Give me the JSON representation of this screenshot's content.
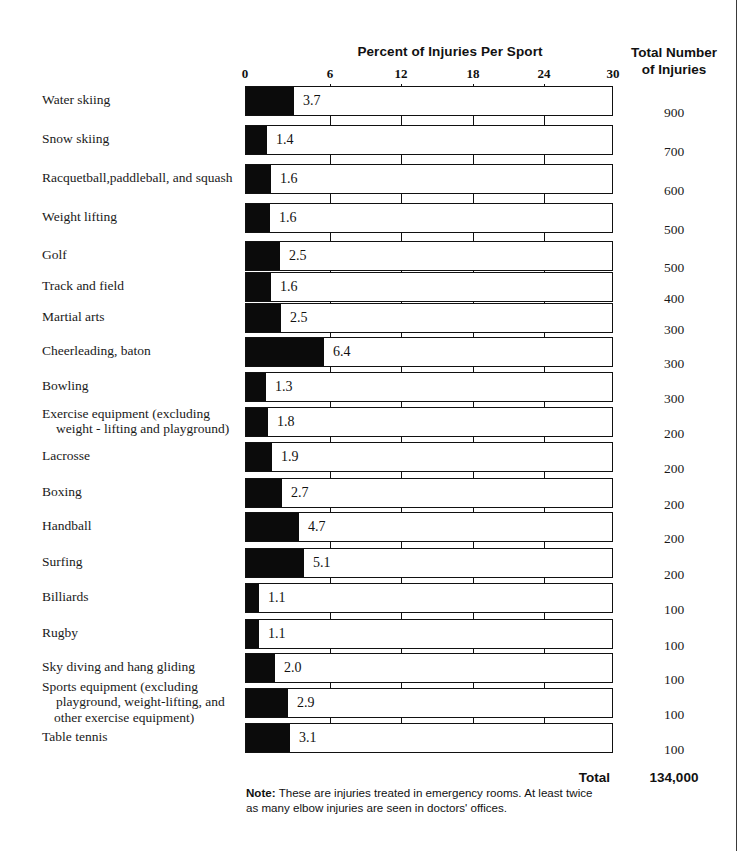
{
  "header": {
    "axis_title": "Percent of Injuries Per Sport",
    "totals_title_line1": "Total Number",
    "totals_title_line2": "of Injuries"
  },
  "footer": {
    "total_label": "Total",
    "total_value": "134,000",
    "note_prefix": "Note:",
    "note_text": " These are injuries treated in emergency rooms. At least twice as many elbow injuries are seen in doctors' offices."
  },
  "colors": {
    "bar_fill": "#0b0b0b",
    "bar_outline": "#111111",
    "text": "#1a1a1a",
    "page_rule": "#3a3a3a"
  },
  "chart_data": {
    "type": "bar",
    "title": "Percent of Injuries Per Sport",
    "xlabel": "Percent of Injuries Per Sport",
    "ylabel": "",
    "orientation": "horizontal",
    "xlim": [
      0,
      30
    ],
    "xticks": [
      0,
      6,
      12,
      18,
      24,
      30
    ],
    "xtick_labels": [
      "0",
      "6",
      "12",
      "18",
      "24",
      "30"
    ],
    "grid": true,
    "legend": "none",
    "value_column_header": "Total Number of Injuries",
    "total": "134,000",
    "categories": [
      "Water skiing",
      "Snow skiing",
      "Racquetball, paddleball, and squash",
      "Weight lifting",
      "Golf",
      "Track and field",
      "Martial arts",
      "Cheerleading, baton",
      "Bowling",
      "Exercise equipment (excluding weight-lifting and playground)",
      "Lacrosse",
      "Boxing",
      "Handball",
      "Surfing",
      "Billiards",
      "Rugby",
      "Sky diving and hang gliding",
      "Sports equipment (excluding playground, weight-lifting, and other exercise equipment)",
      "Table tennis"
    ],
    "values": [
      3.7,
      1.4,
      1.6,
      1.6,
      2.5,
      1.6,
      2.5,
      6.4,
      1.3,
      1.8,
      1.9,
      2.7,
      4.7,
      5.1,
      1.1,
      1.1,
      2.0,
      2.9,
      3.1
    ],
    "value_labels": [
      "3.7",
      "1.4",
      "1.6",
      "1.6",
      "2.5",
      "1.6",
      "2.5",
      "6.4",
      "1.3",
      "1.8",
      "1.9",
      "2.7",
      "4.7",
      "5.1",
      "1.1",
      "1.1",
      "2.0",
      "2.9",
      "3.1"
    ],
    "totals": [
      900,
      700,
      600,
      500,
      500,
      400,
      300,
      300,
      300,
      200,
      200,
      200,
      200,
      200,
      100,
      100,
      100,
      100,
      100
    ],
    "total_labels": [
      "900",
      "700",
      "600",
      "500",
      "500",
      "400",
      "300",
      "300",
      "300",
      "200",
      "200",
      "200",
      "200",
      "200",
      "100",
      "100",
      "100",
      "100",
      "100"
    ]
  },
  "rows": [
    {
      "label": "Water skiing",
      "label_lines": [
        "Water skiing"
      ],
      "value": "3.7",
      "fill_px": 48,
      "total": "900",
      "top": 86
    },
    {
      "label": "Snow skiing",
      "label_lines": [
        "Snow skiing"
      ],
      "value": "1.4",
      "fill_px": 21,
      "total": "700",
      "top": 125
    },
    {
      "label": "Racquetball, paddleball, and squash",
      "label_lines": [
        "Racquetball,paddleball, and squash"
      ],
      "value": "1.6",
      "fill_px": 25,
      "total": "600",
      "top": 164
    },
    {
      "label": "Weight lifting",
      "label_lines": [
        "Weight  lifting"
      ],
      "value": "1.6",
      "fill_px": 24,
      "total": "500",
      "top": 203
    },
    {
      "label": "Golf",
      "label_lines": [
        "Golf"
      ],
      "value": "2.5",
      "fill_px": 34,
      "total": "500",
      "top": 241
    },
    {
      "label": "Track and field",
      "label_lines": [
        "Track and field"
      ],
      "value": "1.6",
      "fill_px": 25,
      "total": "400",
      "top": 272
    },
    {
      "label": "Martial arts",
      "label_lines": [
        "Martial arts"
      ],
      "value": "2.5",
      "fill_px": 35,
      "total": "300",
      "top": 303
    },
    {
      "label": "Cheerleading, baton",
      "label_lines": [
        "Cheerleading, baton"
      ],
      "value": "6.4",
      "fill_px": 78,
      "total": "300",
      "top": 337
    },
    {
      "label": "Bowling",
      "label_lines": [
        "Bowling"
      ],
      "value": "1.3",
      "fill_px": 20,
      "total": "300",
      "top": 372
    },
    {
      "label": "Exercise equipment (excluding weight-lifting and playground)",
      "label_lines": [
        "Exercise equipment (excluding",
        "weight - lifting and playground)"
      ],
      "value": "1.8",
      "fill_px": 22,
      "total": "200",
      "top": 407
    },
    {
      "label": "Lacrosse",
      "label_lines": [
        "Lacrosse"
      ],
      "value": "1.9",
      "fill_px": 26,
      "total": "200",
      "top": 442
    },
    {
      "label": "Boxing",
      "label_lines": [
        "Boxing"
      ],
      "value": "2.7",
      "fill_px": 36,
      "total": "200",
      "top": 478
    },
    {
      "label": "Handball",
      "label_lines": [
        "Handball"
      ],
      "value": "4.7",
      "fill_px": 53,
      "total": "200",
      "top": 512
    },
    {
      "label": "Surfing",
      "label_lines": [
        "Surfing"
      ],
      "value": "5.1",
      "fill_px": 58,
      "total": "200",
      "top": 548
    },
    {
      "label": "Billiards",
      "label_lines": [
        "Billiards"
      ],
      "value": "1.1",
      "fill_px": 13,
      "total": "100",
      "top": 583
    },
    {
      "label": "Rugby",
      "label_lines": [
        "Rugby"
      ],
      "value": "1.1",
      "fill_px": 13,
      "total": "100",
      "top": 619
    },
    {
      "label": "Sky diving and hang gliding",
      "label_lines": [
        "Sky diving and hang gliding"
      ],
      "value": "2.0",
      "fill_px": 29,
      "total": "100",
      "top": 653
    },
    {
      "label": "Sports equipment (excluding playground, weight-lifting, and other exercise equipment)",
      "label_lines": [
        "Sports equipment (excluding",
        "playground, weight-lifting, and",
        "other exercise equipment)"
      ],
      "value": "2.9",
      "fill_px": 42,
      "total": "100",
      "top": 688
    },
    {
      "label": "Table tennis",
      "label_lines": [
        "Table tennis"
      ],
      "value": "3.1",
      "fill_px": 44,
      "total": "100",
      "top": 723
    }
  ],
  "axis": {
    "ticks": [
      {
        "label": "0",
        "x": 0
      },
      {
        "label": "6",
        "x": 85
      },
      {
        "label": "12",
        "x": 156
      },
      {
        "label": "18",
        "x": 228
      },
      {
        "label": "24",
        "x": 299
      },
      {
        "label": "30",
        "x": 368
      }
    ],
    "gridlines_x": [
      85,
      156,
      228,
      299
    ]
  }
}
